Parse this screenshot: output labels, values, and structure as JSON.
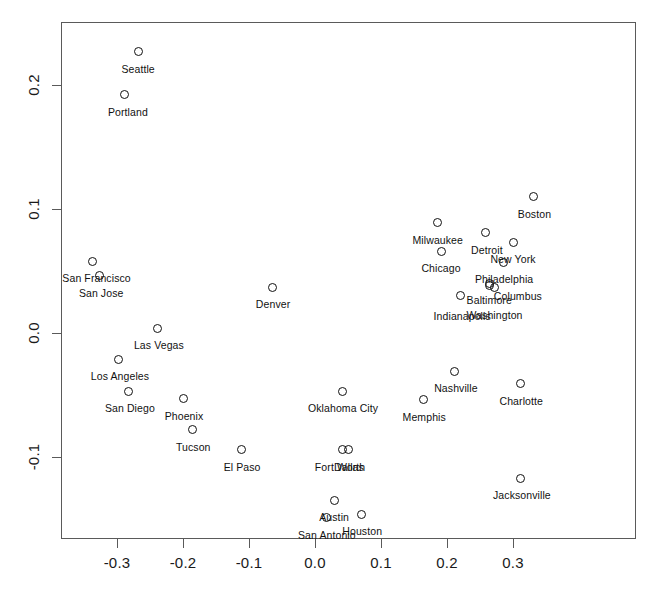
{
  "chart_data": {
    "type": "scatter",
    "title": "",
    "xlabel": "",
    "ylabel": "",
    "xlim": [
      -0.36,
      0.36
    ],
    "ylim": [
      -0.155,
      0.24
    ],
    "grid": false,
    "legend": null,
    "xticks": [
      -0.3,
      -0.2,
      -0.1,
      0.0,
      0.1,
      0.2,
      0.3
    ],
    "xticklabels": [
      "-0.3",
      "-0.2",
      "-0.1",
      "0.0",
      "0.1",
      "0.2",
      "0.3"
    ],
    "yticks": [
      -0.1,
      0.0,
      0.1,
      0.2
    ],
    "yticklabels": [
      "-0.1",
      "0.0",
      "0.1",
      "0.2"
    ],
    "marker": "open-circle",
    "points": [
      {
        "label": "Seattle",
        "x": -0.268,
        "y": 0.227,
        "label_dx": 0,
        "label_dy": 11
      },
      {
        "label": "Portland",
        "x": -0.288,
        "y": 0.192,
        "label_dx": 3,
        "label_dy": 11
      },
      {
        "label": "San Francisco",
        "x": -0.337,
        "y": 0.058,
        "label_dx": 4,
        "label_dy": 11
      },
      {
        "label": "San Jose",
        "x": -0.327,
        "y": 0.046,
        "label_dx": 2,
        "label_dy": 11
      },
      {
        "label": "Boston",
        "x": 0.331,
        "y": 0.11,
        "label_dx": 1,
        "label_dy": 11
      },
      {
        "label": "Milwaukee",
        "x": 0.186,
        "y": 0.089,
        "label_dx": 0,
        "label_dy": 11
      },
      {
        "label": "Detroit",
        "x": 0.259,
        "y": 0.081,
        "label_dx": 1,
        "label_dy": 11
      },
      {
        "label": "Chicago",
        "x": 0.191,
        "y": 0.066,
        "label_dx": 0,
        "label_dy": 11
      },
      {
        "label": "New York",
        "x": 0.3,
        "y": 0.073,
        "label_dx": 0,
        "label_dy": 11
      },
      {
        "label": "Philadelphia",
        "x": 0.285,
        "y": 0.057,
        "label_dx": 1,
        "label_dy": 11
      },
      {
        "label": "Columbus",
        "x": 0.265,
        "y": 0.038,
        "label_dx": 28,
        "label_dy": 4
      },
      {
        "label": "Baltimore",
        "x": 0.264,
        "y": 0.04,
        "label_dx": 0,
        "label_dy": 11
      },
      {
        "label": "Washington",
        "x": 0.272,
        "y": 0.037,
        "label_dx": 0,
        "label_dy": 22
      },
      {
        "label": "Indianapolis",
        "x": 0.22,
        "y": 0.03,
        "label_dx": 2,
        "label_dy": 14
      },
      {
        "label": "Denver",
        "x": -0.065,
        "y": 0.037,
        "label_dx": 1,
        "label_dy": 11
      },
      {
        "label": "Las Vegas",
        "x": -0.238,
        "y": 0.004,
        "label_dx": 1,
        "label_dy": 11
      },
      {
        "label": "Los Angeles",
        "x": -0.297,
        "y": -0.021,
        "label_dx": 1,
        "label_dy": 11
      },
      {
        "label": "San Diego",
        "x": -0.282,
        "y": -0.047,
        "label_dx": 1,
        "label_dy": 11
      },
      {
        "label": "Phoenix",
        "x": -0.2,
        "y": -0.053,
        "label_dx": 1,
        "label_dy": 11
      },
      {
        "label": "Tucson",
        "x": -0.186,
        "y": -0.078,
        "label_dx": 1,
        "label_dy": 11
      },
      {
        "label": "El Paso",
        "x": -0.112,
        "y": -0.094,
        "label_dx": 1,
        "label_dy": 11
      },
      {
        "label": "Oklahoma City",
        "x": 0.041,
        "y": -0.047,
        "label_dx": 1,
        "label_dy": 11
      },
      {
        "label": "Memphis",
        "x": 0.164,
        "y": -0.054,
        "label_dx": 1,
        "label_dy": 11
      },
      {
        "label": "Nashville",
        "x": 0.212,
        "y": -0.031,
        "label_dx": 1,
        "label_dy": 11
      },
      {
        "label": "Charlotte",
        "x": 0.311,
        "y": -0.041,
        "label_dx": 1,
        "label_dy": 11
      },
      {
        "label": "Fort Worth",
        "x": 0.041,
        "y": -0.094,
        "label_dx": -2,
        "label_dy": 11
      },
      {
        "label": "Dallas",
        "x": 0.05,
        "y": -0.094,
        "label_dx": 1,
        "label_dy": 11
      },
      {
        "label": "Jacksonville",
        "x": 0.312,
        "y": -0.117,
        "label_dx": 1,
        "label_dy": 11
      },
      {
        "label": "Austin",
        "x": 0.029,
        "y": -0.135,
        "label_dx": 0,
        "label_dy": 11
      },
      {
        "label": "San Antonio",
        "x": 0.018,
        "y": -0.149,
        "label_dx": 0,
        "label_dy": 11
      },
      {
        "label": "Houston",
        "x": 0.07,
        "y": -0.146,
        "label_dx": 1,
        "label_dy": 11
      }
    ]
  },
  "style": {
    "frame_color": "#5a5a5a",
    "point_color": "#111111",
    "text_color": "#111111",
    "background": "#ffffff"
  }
}
